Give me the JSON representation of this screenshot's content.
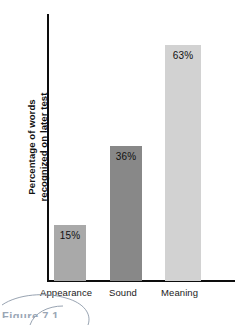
{
  "chart_data": {
    "type": "bar",
    "title": "",
    "xlabel": "",
    "ylabel_line1": "Percentage of words",
    "ylabel_line2": "recognized on later test",
    "categories": [
      "Appearance",
      "Sound",
      "Meaning"
    ],
    "values": [
      15,
      36,
      63
    ],
    "value_labels": [
      "15%",
      "36%",
      "63%"
    ],
    "ylim": [
      0,
      74
    ],
    "grid": false,
    "legend": null,
    "bar_colors": [
      "#a9a9a9",
      "#888888",
      "#d2d2d2"
    ],
    "axis_color": "#0d0d0d"
  },
  "figure": {
    "caption_fragment": "Figure 7.1"
  }
}
